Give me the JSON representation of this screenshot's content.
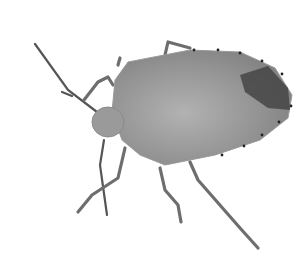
{
  "image": {
    "subject": "stink bug",
    "background_color": "#ffffff",
    "colors": {
      "body": "#8e8e8e",
      "body_light": "#a8a8a8",
      "dark_patch": "#3a3a3a",
      "legs": "#6e6e6e",
      "edge_dots": "#222222"
    }
  }
}
